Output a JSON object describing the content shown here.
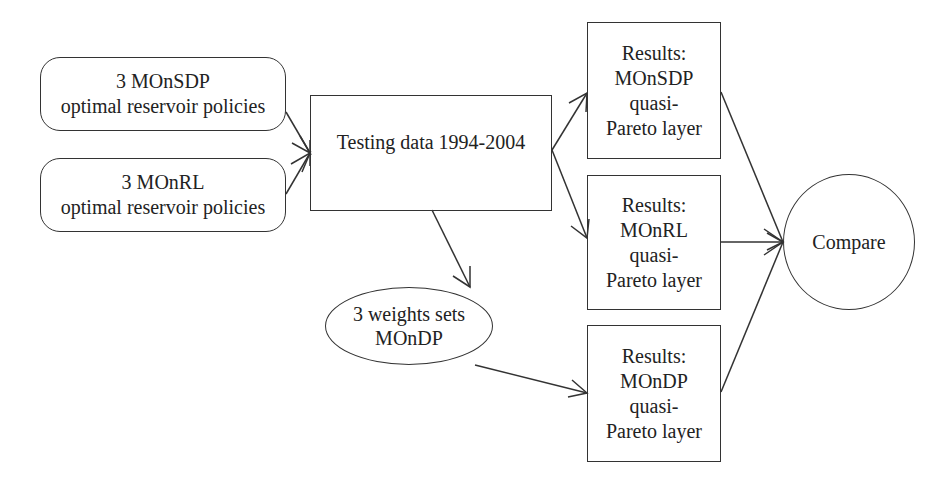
{
  "diagram": {
    "type": "flowchart",
    "nodes": {
      "monsdp_policies": {
        "line1": "3 MOnSDP",
        "line2": "optimal reservoir policies"
      },
      "monrl_policies": {
        "line1": "3 MOnRL",
        "line2": "optimal reservoir policies"
      },
      "testing_data": {
        "label": "Testing data 1994-2004"
      },
      "weights_sets": {
        "line1": "3 weights sets",
        "line2": "MOnDP"
      },
      "results_monsdp": {
        "line1": "Results:",
        "line2": "MOnSDP",
        "line3": "quasi-",
        "line4": "Pareto layer"
      },
      "results_monrl": {
        "line1": "Results:",
        "line2": "MOnRL",
        "line3": "quasi-",
        "line4": "Pareto layer"
      },
      "results_mondp": {
        "line1": "Results:",
        "line2": "MOnDP",
        "line3": "quasi-",
        "line4": "Pareto layer"
      },
      "compare": {
        "label": "Compare"
      }
    },
    "edges": [
      {
        "from": "monsdp_policies",
        "to": "testing_data"
      },
      {
        "from": "monrl_policies",
        "to": "testing_data"
      },
      {
        "from": "testing_data",
        "to": "results_monsdp"
      },
      {
        "from": "testing_data",
        "to": "results_monrl"
      },
      {
        "from": "testing_data",
        "to": "weights_sets"
      },
      {
        "from": "weights_sets",
        "to": "results_mondp"
      },
      {
        "from": "results_monsdp",
        "to": "compare"
      },
      {
        "from": "results_monrl",
        "to": "compare"
      },
      {
        "from": "results_mondp",
        "to": "compare"
      }
    ],
    "colors": {
      "stroke": "#333333",
      "text": "#222222",
      "background": "#ffffff"
    }
  }
}
